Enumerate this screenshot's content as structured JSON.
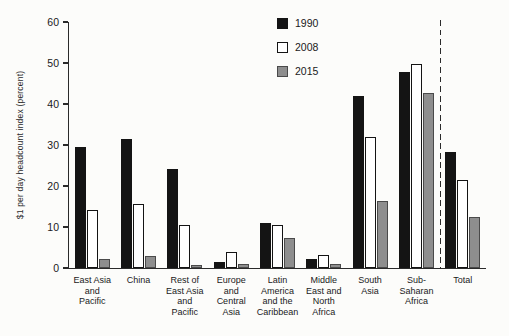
{
  "figure": {
    "background": "#fcfcfa",
    "axis_color": "#2a2a2a"
  },
  "chart_data": {
    "type": "bar",
    "title": "",
    "xlabel": "",
    "ylabel": "$1 per day headcount index (percent)",
    "ylim": [
      0,
      60
    ],
    "yticks": [
      0,
      10,
      20,
      30,
      40,
      50,
      60
    ],
    "grid": false,
    "legend_position": "top-center-inside",
    "categories": [
      "East Asia and Pacific",
      "China",
      "Rest of East Asia and Pacific",
      "Europe and Central Asia",
      "Latin America and the Caribbean",
      "Middle East and North Africa",
      "South Asia",
      "Sub-Saharan Africa",
      "Total"
    ],
    "category_labels_multiline": [
      "East Asia\nand\nPacific",
      "China",
      "Rest of\nEast Asia\nand\nPacific",
      "Europe\nand\nCentral\nAsia",
      "Latin\nAmerica\nand the\nCaribbean",
      "Middle\nEast and\nNorth\nAfrica",
      "South\nAsia",
      "Sub-\nSaharan\nAfrica",
      "Total"
    ],
    "series": [
      {
        "name": "1990",
        "color": "#141414",
        "border": "#141414",
        "values": [
          29.5,
          31.5,
          24.2,
          1.4,
          11.0,
          2.2,
          42.0,
          47.7,
          28.4
        ]
      },
      {
        "name": "2008",
        "color": "#ffffff",
        "border": "#141414",
        "values": [
          14.2,
          15.5,
          10.4,
          4.0,
          10.5,
          3.1,
          32.0,
          49.8,
          21.5
        ]
      },
      {
        "name": "2015",
        "color": "#8e8e8e",
        "border": "#4a4a4a",
        "values": [
          2.3,
          3.0,
          0.8,
          0.9,
          7.4,
          1.0,
          16.4,
          42.7,
          12.4
        ]
      }
    ],
    "separator": {
      "style": "vertical-dashed-line",
      "between": [
        "Sub-Saharan Africa",
        "Total"
      ]
    }
  }
}
